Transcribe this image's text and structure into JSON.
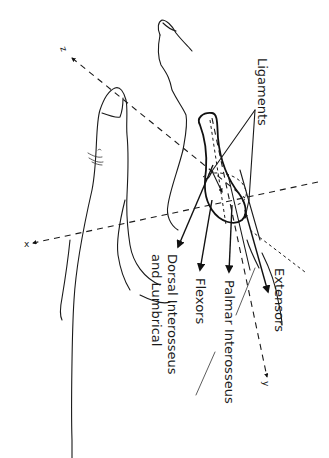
{
  "diagram": {
    "labels": {
      "ligaments": "Ligaments",
      "extensors": "Extensors",
      "palmar_interosseus": "Palmar Interosseus",
      "flexors": "Flexors",
      "dorsal_line1": "Dorsal Interosseus",
      "dorsal_line2": "and Lumbrical"
    },
    "axes": {
      "x": "x",
      "y": "y",
      "z": "z"
    },
    "colors": {
      "ink": "#1a1a1a",
      "background": "#ffffff"
    }
  }
}
